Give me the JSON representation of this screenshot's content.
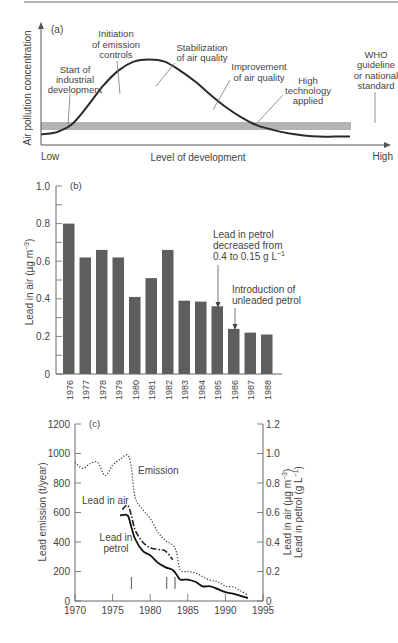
{
  "chart_data": [
    {
      "panel": "(a)",
      "type": "line",
      "title": "",
      "xlabel": "Level of development",
      "ylabel": "Air pollution concentration",
      "x_ticks": [
        "Low",
        "High"
      ],
      "series": [
        {
          "name": "Air pollution curve",
          "x": [
            0,
            0.05,
            0.1,
            0.15,
            0.2,
            0.25,
            0.3,
            0.35,
            0.4,
            0.45,
            0.5,
            0.55,
            0.6,
            0.65,
            0.7,
            0.75,
            0.8,
            0.85,
            0.9,
            0.95,
            1.0
          ],
          "values": [
            0.05,
            0.07,
            0.14,
            0.3,
            0.48,
            0.62,
            0.7,
            0.72,
            0.7,
            0.62,
            0.52,
            0.4,
            0.29,
            0.2,
            0.13,
            0.09,
            0.06,
            0.04,
            0.03,
            0.03,
            0.03
          ]
        }
      ],
      "band": {
        "name": "WHO guideline or national standard",
        "low": 0.1,
        "high": 0.17
      },
      "annotations": [
        "Start of industrial development",
        "Initiation of emission controls",
        "Stabilization of air quality",
        "Improvement of air quality",
        "High technology applied",
        "WHO guideline or national standard"
      ]
    },
    {
      "panel": "(b)",
      "type": "bar",
      "categories": [
        "1976",
        "1977",
        "1978",
        "1979",
        "1980",
        "1981",
        "1982",
        "1983",
        "1984",
        "1985",
        "1986",
        "1987",
        "1988"
      ],
      "values": [
        0.8,
        0.62,
        0.66,
        0.62,
        0.41,
        0.51,
        0.66,
        0.39,
        0.385,
        0.36,
        0.24,
        0.22,
        0.21
      ],
      "xlabel": "",
      "ylabel": "Lead in air (µg m⁻³)",
      "ylim": [
        0,
        1.0
      ],
      "y_ticks": [
        "0",
        "0.2",
        "0.4",
        "0.6",
        "0.8",
        "1.0"
      ],
      "annotations": [
        {
          "text": "Lead in petrol decreased from 0.4 to 0.15 g L⁻¹",
          "target": "1985"
        },
        {
          "text": "Introduction of unleaded petrol",
          "target": "1986"
        }
      ]
    },
    {
      "panel": "(c)",
      "type": "line",
      "xlabel": "",
      "ylabel_left": "Lead emission (t/year)",
      "ylabel_right": [
        "Lead in air (µg m⁻³)",
        "Lead in petrol (g L⁻¹)"
      ],
      "xlim": [
        1970,
        1995
      ],
      "ylim_left": [
        0,
        1200
      ],
      "ylim_right": [
        0,
        1.2
      ],
      "x_ticks": [
        "1970",
        "1975",
        "1980",
        "1985",
        "1990",
        "1995"
      ],
      "y_ticks_left": [
        "0",
        "200",
        "400",
        "600",
        "800",
        "1000",
        "1200"
      ],
      "y_ticks_right": [
        "0",
        "0.2",
        "0.4",
        "0.6",
        "0.8",
        "1.0",
        "1.2"
      ],
      "series": [
        {
          "name": "Emission",
          "style": "dotted",
          "axis": "left",
          "x": [
            1970,
            1971,
            1972,
            1973,
            1974,
            1975,
            1976,
            1977,
            1977.5,
            1978,
            1979,
            1980,
            1981,
            1982,
            1983,
            1983.5,
            1984,
            1985,
            1986,
            1987,
            1988,
            1989,
            1990,
            1991,
            1992,
            1993
          ],
          "values": [
            940,
            900,
            930,
            940,
            850,
            920,
            960,
            990,
            900,
            700,
            620,
            560,
            470,
            410,
            380,
            330,
            210,
            200,
            190,
            165,
            140,
            130,
            100,
            95,
            70,
            40
          ]
        },
        {
          "name": "Lead in air",
          "style": "dash-dot",
          "axis": "right",
          "x": [
            1976.3,
            1977,
            1977.5,
            1978,
            1979,
            1980,
            1981,
            1982,
            1983
          ],
          "values": [
            0.62,
            0.65,
            0.58,
            0.48,
            0.4,
            0.36,
            0.35,
            0.34,
            0.28
          ]
        },
        {
          "name": "Lead in petrol",
          "style": "solid",
          "axis": "right",
          "x": [
            1976,
            1977,
            1977.5,
            1978,
            1979,
            1980,
            1981,
            1982,
            1983,
            1983.5,
            1984,
            1985,
            1986,
            1987,
            1988,
            1989,
            1990,
            1991,
            1992,
            1993
          ],
          "values": [
            0.58,
            0.58,
            0.5,
            0.42,
            0.34,
            0.31,
            0.26,
            0.23,
            0.21,
            0.18,
            0.145,
            0.145,
            0.13,
            0.1,
            0.1,
            0.08,
            0.06,
            0.05,
            0.035,
            0.02
          ]
        }
      ],
      "event_markers_x": [
        1977.5,
        1982.2,
        1983.3
      ],
      "labels": [
        "Emission",
        "Lead in air",
        "Lead in petrol"
      ]
    }
  ],
  "panels": {
    "a": {
      "tag": "(a)",
      "ylabel": "Air pollution concentration",
      "xlabel": "Level of development",
      "low": "Low",
      "high": "High",
      "notes": {
        "start": [
          "Start of",
          "industrial",
          "development"
        ],
        "init": [
          "Initiation",
          "of emission",
          "controls"
        ],
        "stab": [
          "Stabilization",
          "of air quality"
        ],
        "improve": [
          "Improvement",
          "of air quality"
        ],
        "hightech": [
          "High",
          "technology",
          "applied"
        ],
        "who": [
          "WHO",
          "guideline",
          "or national",
          "standard"
        ]
      }
    },
    "b": {
      "tag": "(b)",
      "ylabel": "Lead in air (µg m",
      "ylabel_sup": "−3",
      "ylabel_end": ")",
      "note1": [
        "Lead in petrol",
        "decreased from",
        "0.4 to 0.15 g L"
      ],
      "note1_sup": "−1",
      "note2": [
        "Introduction of",
        "unleaded petrol"
      ]
    },
    "c": {
      "tag": "(c)",
      "ylabel_left": "Lead emission (t/year)",
      "ylabel_right1": "Lead in air (µg m",
      "ylabel_right1_sup": "−3",
      "ylabel_right2": "Lead in petrol (g L",
      "ylabel_right2_sup": "−1",
      "label_emission": "Emission",
      "label_air": "Lead in air",
      "label_petrol": [
        "Lead in",
        "petrol"
      ]
    }
  }
}
